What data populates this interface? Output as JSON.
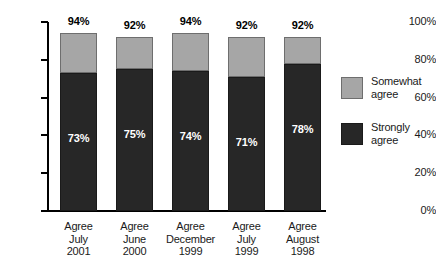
{
  "chart_data": {
    "type": "bar",
    "subtype": "stacked-bar",
    "title": "",
    "subtitle": "",
    "xlabel": "",
    "ylabel": "",
    "ylim": [
      0,
      100
    ],
    "yticks": [
      "0%",
      "20%",
      "40%",
      "60%",
      "80%",
      "100%"
    ],
    "ytick_values": [
      0,
      20,
      40,
      60,
      80,
      100
    ],
    "grid": false,
    "legend_position": "right",
    "categories": [
      "Agree\nJuly\n2001",
      "Agree\nJune\n2000",
      "Agree\nDecember\n1999",
      "Agree\nJuly\n1999",
      "Agree\nAugust\n1998"
    ],
    "category_lines": [
      [
        "Agree",
        "July",
        "2001"
      ],
      [
        "Agree",
        "June",
        "2000"
      ],
      [
        "Agree",
        "December",
        "1999"
      ],
      [
        "Agree",
        "July",
        "1999"
      ],
      [
        "Agree",
        "August",
        "1998"
      ]
    ],
    "series": [
      {
        "name": "Strongly agree",
        "color": "#272727",
        "values": [
          73,
          75,
          74,
          71,
          78
        ],
        "labels": [
          "73%",
          "75%",
          "74%",
          "71%",
          "78%"
        ]
      },
      {
        "name": "Somewhat agree",
        "color": "#a6a6a6",
        "values": [
          21,
          17,
          20,
          21,
          14
        ],
        "labels": [
          "",
          "",
          "",
          "",
          ""
        ]
      }
    ],
    "totals": [
      94,
      92,
      94,
      92,
      92
    ],
    "total_labels": [
      "94%",
      "92%",
      "94%",
      "92%",
      "92%"
    ]
  },
  "axis": {
    "y_ticks": [
      {
        "label": "100%",
        "value": 100
      },
      {
        "label": "80%",
        "value": 80
      },
      {
        "label": "60%",
        "value": 60
      },
      {
        "label": "40%",
        "value": 40
      },
      {
        "label": "20%",
        "value": 20
      },
      {
        "label": "0%",
        "value": 0
      }
    ]
  },
  "legend": {
    "items": [
      {
        "label_line1": "Somewhat",
        "label_line2": "agree",
        "color": "#a6a6a6"
      },
      {
        "label_line1": "Strongly",
        "label_line2": "agree",
        "color": "#272727"
      }
    ]
  },
  "bars": [
    {
      "total_label": "94%",
      "strong_label": "73%",
      "line1": "Agree",
      "line2": "July",
      "line3": "2001"
    },
    {
      "total_label": "92%",
      "strong_label": "75%",
      "line1": "Agree",
      "line2": "June",
      "line3": "2000"
    },
    {
      "total_label": "94%",
      "strong_label": "74%",
      "line1": "Agree",
      "line2": "December",
      "line3": "1999"
    },
    {
      "total_label": "92%",
      "strong_label": "71%",
      "line1": "Agree",
      "line2": "July",
      "line3": "1999"
    },
    {
      "total_label": "92%",
      "strong_label": "78%",
      "line1": "Agree",
      "line2": "August",
      "line3": "1998"
    }
  ]
}
